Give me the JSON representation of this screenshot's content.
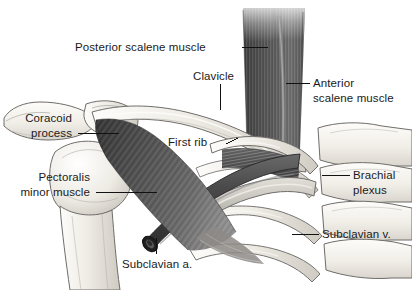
{
  "figure": {
    "background_color": "#ffffff",
    "label_text_color": "#1a1a1a",
    "leader_line_color": "#111111",
    "bone_fill": "#f2efe9",
    "bone_outline": "#6f6d6a",
    "muscle_dark": "#4a4a4a",
    "muscle_mid": "#777777",
    "artery_color": "#4f4f4f",
    "vein_color": "#b9b6b0",
    "plexus_color": "#5c5c5c"
  },
  "labels": [
    {
      "id": "posterior-scalene-muscle",
      "line1": "Posterior scalene muscle",
      "line2": "",
      "x": 75,
      "y": 40,
      "align": "left"
    },
    {
      "id": "clavicle",
      "line1": "Clavicle",
      "line2": "",
      "x": 193,
      "y": 69,
      "align": "left"
    },
    {
      "id": "anterior-scalene-muscle",
      "line1": "Anterior",
      "line2": "scalene muscle",
      "x": 313,
      "y": 76,
      "align": "left"
    },
    {
      "id": "coracoid-process",
      "line1": "Coracoid",
      "line2": "process",
      "x": 72,
      "y": 111,
      "align": "right"
    },
    {
      "id": "first-rib",
      "line1": "First rib",
      "line2": "",
      "x": 168,
      "y": 135,
      "align": "left"
    },
    {
      "id": "brachial-plexus",
      "line1": "Brachial",
      "line2": "plexus",
      "x": 353,
      "y": 168,
      "align": "left"
    },
    {
      "id": "pectoralis-minor-muscle",
      "line1": "Pectoralis",
      "line2": "minor muscle",
      "x": 90,
      "y": 170,
      "align": "right"
    },
    {
      "id": "subclavian-vein",
      "line1": "Subclavian v.",
      "line2": "",
      "x": 322,
      "y": 227,
      "align": "left"
    },
    {
      "id": "subclavian-artery",
      "line1": "Subclavian a.",
      "line2": "",
      "x": 122,
      "y": 257,
      "align": "left"
    }
  ],
  "structures": [
    {
      "id": "clavicle",
      "name": "Clavicle"
    },
    {
      "id": "first-rib",
      "name": "First rib"
    },
    {
      "id": "coracoid-process",
      "name": "Coracoid process"
    },
    {
      "id": "humeral-head",
      "name": "Humeral head"
    },
    {
      "id": "scapula",
      "name": "Scapula"
    },
    {
      "id": "sternum-segments",
      "name": "Sternum / costal cartilages"
    },
    {
      "id": "ribs-lower",
      "name": "Lower ribs"
    },
    {
      "id": "anterior-scalene-muscle",
      "name": "Anterior scalene muscle"
    },
    {
      "id": "posterior-scalene-muscle",
      "name": "Posterior scalene muscle"
    },
    {
      "id": "pectoralis-minor-muscle",
      "name": "Pectoralis minor muscle"
    },
    {
      "id": "brachial-plexus",
      "name": "Brachial plexus"
    },
    {
      "id": "subclavian-artery",
      "name": "Subclavian artery"
    },
    {
      "id": "subclavian-vein",
      "name": "Subclavian vein"
    }
  ]
}
